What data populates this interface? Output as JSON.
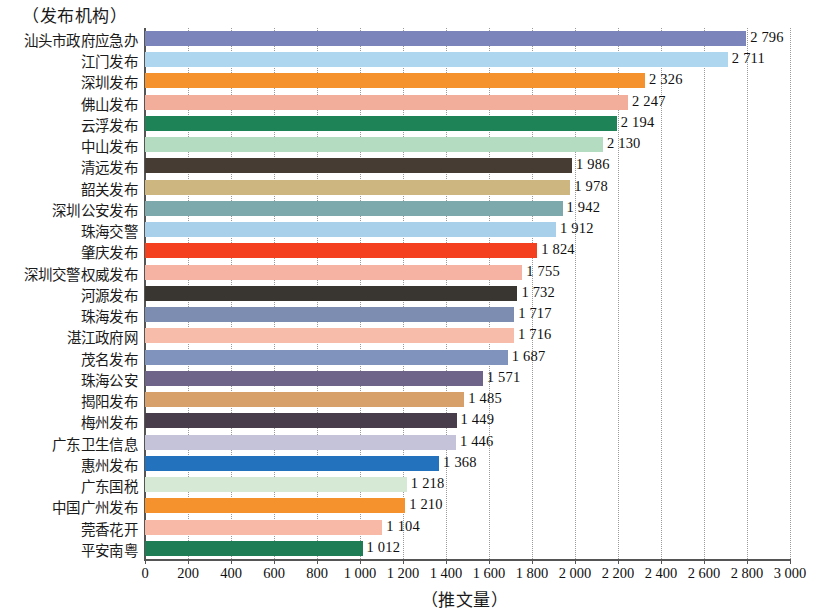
{
  "chart_data": {
    "type": "bar",
    "orientation": "horizontal",
    "title": "",
    "xlabel": "（推文量）",
    "ylabel": "（发布机构）",
    "xlim": [
      0,
      3000
    ],
    "xticks": [
      "0",
      "200",
      "400",
      "600",
      "800",
      "1 000",
      "1 200",
      "1 400",
      "1 600",
      "1 800",
      "2 000",
      "2 200",
      "2 400",
      "2 600",
      "2 800",
      "3 000"
    ],
    "xtick_values": [
      0,
      200,
      400,
      600,
      800,
      1000,
      1200,
      1400,
      1600,
      1800,
      2000,
      2200,
      2400,
      2600,
      2800,
      3000
    ],
    "grid": "vertical-dotted",
    "legend": "none",
    "categories": [
      "汕头市政府应急办",
      "江门发布",
      "深圳发布",
      "佛山发布",
      "云浮发布",
      "中山发布",
      "清远发布",
      "韶关发布",
      "深圳公安发布",
      "珠海交警",
      "肇庆发布",
      "深圳交警权威发布",
      "河源发布",
      "珠海发布",
      "湛江政府网",
      "茂名发布",
      "珠海公安",
      "揭阳发布",
      "梅州发布",
      "广东卫生信息",
      "惠州发布",
      "广东国税",
      "中国广州发布",
      "莞香花开",
      "平安南粤"
    ],
    "values": [
      2796,
      2711,
      2326,
      2247,
      2194,
      2130,
      1986,
      1978,
      1942,
      1912,
      1824,
      1755,
      1732,
      1717,
      1716,
      1687,
      1571,
      1485,
      1449,
      1446,
      1368,
      1218,
      1210,
      1104,
      1012
    ],
    "value_labels": [
      "2 796",
      "2 711",
      "2 326",
      "2 247",
      "2 194",
      "2 130",
      "1 986",
      "1 978",
      "1 942",
      "1 912",
      "1 824",
      "1 755",
      "1 732",
      "1 717",
      "1 716",
      "1 687",
      "1 571",
      "1 485",
      "1 449",
      "1 446",
      "1 368",
      "1 218",
      "1 210",
      "1 104",
      "1 012"
    ],
    "colors": [
      "#7b85bc",
      "#afd6ef",
      "#f6922d",
      "#f2ae9b",
      "#1e8356",
      "#b4dcc0",
      "#463c33",
      "#cdb67f",
      "#7da9ad",
      "#a9d0ea",
      "#f4401e",
      "#f6b3a3",
      "#393632",
      "#7d8cb1",
      "#f8bdaa",
      "#8093bd",
      "#6e6389",
      "#d7a06a",
      "#483e4b",
      "#c5c3d9",
      "#2272bd",
      "#d6e9d5",
      "#f6922d",
      "#f8b9a6",
      "#1e7d54"
    ]
  }
}
